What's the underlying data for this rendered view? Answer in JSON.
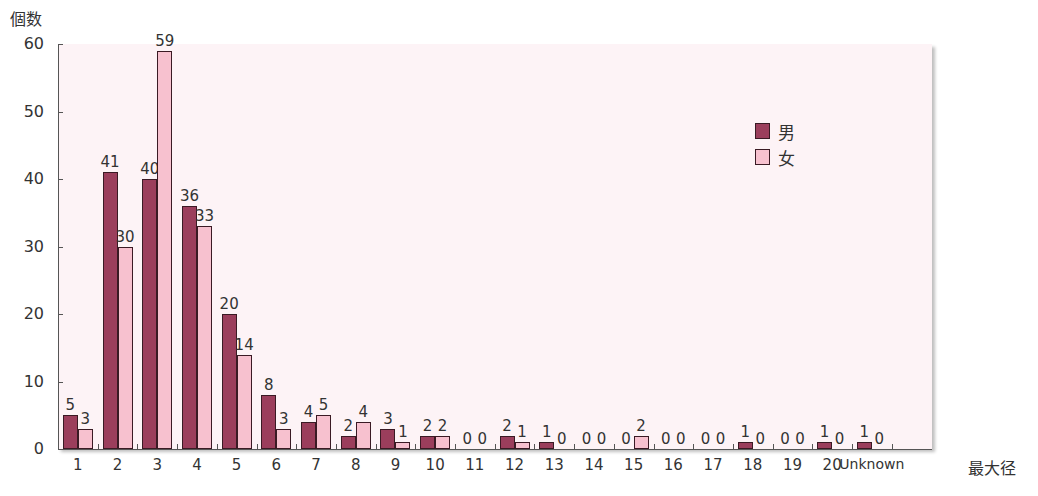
{
  "chart_data": {
    "type": "bar",
    "title": "",
    "ylabel": "個数",
    "xlabel": "最大径",
    "ylim": [
      0,
      60
    ],
    "yticks": [
      0,
      10,
      20,
      30,
      40,
      50,
      60
    ],
    "grid": false,
    "legend_position": "upper right (inside plot)",
    "categories": [
      "1",
      "2",
      "3",
      "4",
      "5",
      "6",
      "7",
      "8",
      "9",
      "10",
      "11",
      "12",
      "13",
      "14",
      "15",
      "16",
      "17",
      "18",
      "19",
      "20",
      "Unknown"
    ],
    "series": [
      {
        "name": "男",
        "color": "#9b3e5c",
        "values": [
          5,
          41,
          40,
          36,
          20,
          8,
          4,
          2,
          3,
          2,
          0,
          2,
          1,
          0,
          0,
          0,
          0,
          1,
          0,
          1,
          1
        ]
      },
      {
        "name": "女",
        "color": "#f7c1cf",
        "values": [
          3,
          30,
          59,
          33,
          14,
          3,
          5,
          4,
          1,
          2,
          0,
          1,
          0,
          0,
          2,
          0,
          0,
          0,
          0,
          0,
          0
        ]
      }
    ]
  },
  "labels": {
    "y_title": "個数",
    "x_title": "最大径"
  }
}
